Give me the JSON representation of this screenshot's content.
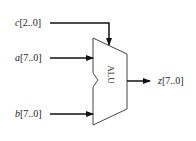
{
  "diagram": {
    "block": {
      "label": "ALU"
    },
    "inputs": [
      {
        "name": "c",
        "range": "[2..0]",
        "role": "control"
      },
      {
        "name": "a",
        "range": "[7..0]",
        "role": "operand"
      },
      {
        "name": "b",
        "range": "[7..0]",
        "role": "operand"
      }
    ],
    "outputs": [
      {
        "name": "z",
        "range": "[7..0]"
      }
    ],
    "colors": {
      "line": "#111111",
      "text": "#222222",
      "background": "#ffffff"
    }
  }
}
